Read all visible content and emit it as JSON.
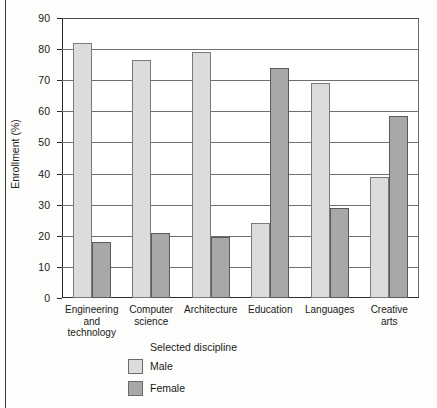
{
  "chart_data": {
    "type": "bar",
    "title": "",
    "subtitle": "",
    "xlabel": "Selected discipline",
    "ylabel": "Enrollment (%)",
    "ylim": [
      0,
      90
    ],
    "ytick_step": 10,
    "yticks": [
      "90",
      "80",
      "70",
      "60",
      "50",
      "40",
      "30",
      "20",
      "10",
      "0"
    ],
    "grid": true,
    "grid_axis": "y",
    "legend_position": "bottom-center",
    "categories": [
      "Engineering and technology",
      "Computer science",
      "Architecture",
      "Education",
      "Languages",
      "Creative arts"
    ],
    "category_lines": [
      [
        "Engineering",
        "and",
        "technology"
      ],
      [
        "Computer",
        "science"
      ],
      [
        "Architecture"
      ],
      [
        "Education"
      ],
      [
        "Languages"
      ],
      [
        "Creative",
        "arts"
      ]
    ],
    "series": [
      {
        "name": "Male",
        "color": "#dcdcdc",
        "values": [
          82,
          76.5,
          79,
          24,
          69,
          39
        ]
      },
      {
        "name": "Female",
        "color": "#a8a8a8",
        "values": [
          18,
          21,
          19.5,
          74,
          29,
          58.5
        ]
      }
    ]
  },
  "legend": {
    "items": [
      {
        "label": "Male",
        "color": "#dcdcdc"
      },
      {
        "label": "Female",
        "color": "#a8a8a8"
      }
    ]
  }
}
